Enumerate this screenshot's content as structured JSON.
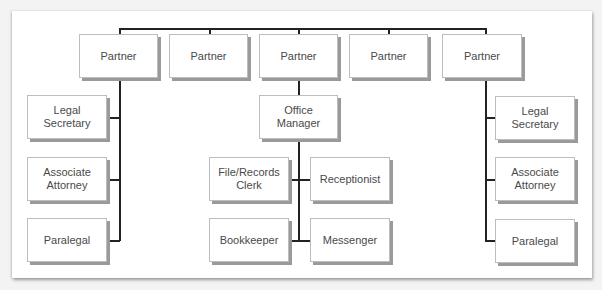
{
  "chart": {
    "type": "org-chart",
    "partners": [
      "Partner",
      "Partner",
      "Partner",
      "Partner",
      "Partner"
    ],
    "left_staff": [
      "Legal Secretary",
      "Associate Attorney",
      "Paralegal"
    ],
    "office_manager": "Office Manager",
    "office_staff": [
      "File/Records Clerk",
      "Receptionist",
      "Bookkeeper",
      "Messenger"
    ],
    "right_staff": [
      "Legal Secretary",
      "Associate Attorney",
      "Paralegal"
    ]
  },
  "colors": {
    "line": "#222222",
    "box_fill": "#ffffff",
    "box_shadow": "#9a9a9a",
    "text": "#4a4a4a"
  }
}
